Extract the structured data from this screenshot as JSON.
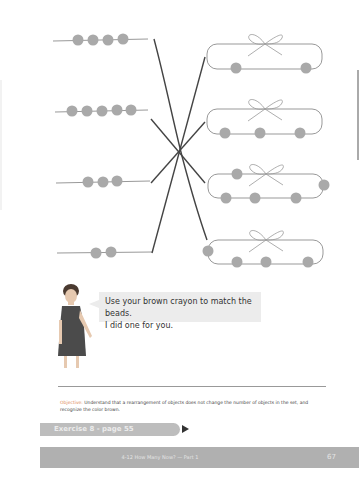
{
  "worksheet": {
    "instruction_line1": "Use your brown crayon to match the beads.",
    "instruction_line2": "I did one for you.",
    "objective_label": "Objective:",
    "objective_text": "Understand that a rearrangement of objects does not change the number of objects in the set, and recognize the color brown.",
    "exercise_label": "Exercise 8 - page 55",
    "footer_title": "4-12 How Many Now? — Part 1",
    "page_number": "67"
  },
  "bead_strings": [
    {
      "count": 4
    },
    {
      "count": 5
    },
    {
      "count": 3
    },
    {
      "count": 2
    }
  ],
  "bracelets": [
    {
      "count": 2
    },
    {
      "count": 3
    },
    {
      "count": 5
    },
    {
      "count": 4
    }
  ],
  "colors": {
    "bead": "#a9a9a9",
    "match_line": "#444444",
    "footer_bar": "#b0b0b0",
    "exercise_tab": "#bdbdbd",
    "objective_label": "#e08a5a"
  }
}
